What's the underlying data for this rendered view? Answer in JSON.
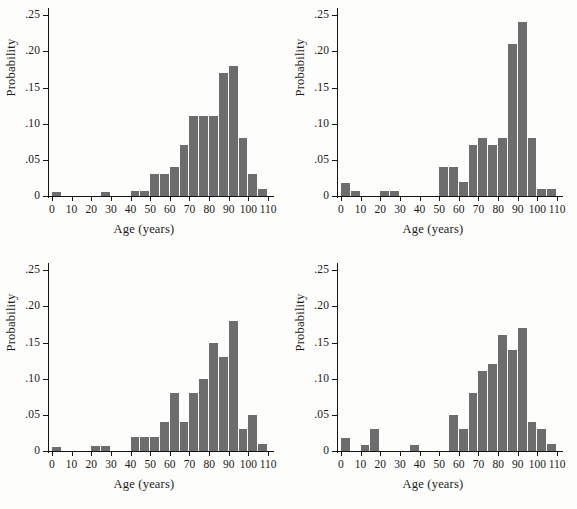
{
  "figure": {
    "background_color": "#fdfdfb",
    "bar_color": "#6d6d6d",
    "axis_color": "#141414",
    "panel_count": 4
  },
  "axes": {
    "x_title": "Age (years)",
    "y_title": "Probability",
    "x_ticks": [
      0,
      10,
      20,
      30,
      40,
      50,
      60,
      70,
      80,
      90,
      100,
      110
    ],
    "x_tick_labels": [
      "0",
      "10",
      "20",
      "30",
      "40",
      "50",
      "60",
      "70",
      "80",
      "90",
      "100",
      "110"
    ],
    "y_ticks": [
      0,
      0.05,
      0.1,
      0.15,
      0.2,
      0.25
    ],
    "y_tick_labels": [
      "0",
      ".05",
      ".10",
      ".15",
      ".20",
      ".25"
    ],
    "xlim": [
      -2,
      113
    ],
    "ylim": [
      0,
      0.26
    ],
    "bin_width": 5,
    "grid": false,
    "legend": false
  },
  "chart_data": [
    {
      "id": "panel-top-left",
      "type": "bar",
      "title": "",
      "xlabel": "Age (years)",
      "ylabel": "Probability",
      "xlim": [
        -2,
        113
      ],
      "ylim": [
        0,
        0.26
      ],
      "grid": false,
      "bin_width": 5,
      "bin_starts": [
        0,
        5,
        10,
        15,
        20,
        25,
        30,
        35,
        40,
        45,
        50,
        55,
        60,
        65,
        70,
        75,
        80,
        85,
        90,
        95,
        100,
        105
      ],
      "categories": [
        "0-5",
        "5-10",
        "10-15",
        "15-20",
        "20-25",
        "25-30",
        "30-35",
        "35-40",
        "40-45",
        "45-50",
        "50-55",
        "55-60",
        "60-65",
        "65-70",
        "70-75",
        "75-80",
        "80-85",
        "85-90",
        "90-95",
        "95-100",
        "100-105",
        "105-110"
      ],
      "values": [
        0.005,
        0,
        0,
        0,
        0,
        0.005,
        0,
        0,
        0.007,
        0.007,
        0.03,
        0.03,
        0.04,
        0.07,
        0.11,
        0.11,
        0.11,
        0.17,
        0.18,
        0.08,
        0.03,
        0.01
      ]
    },
    {
      "id": "panel-top-right",
      "type": "bar",
      "title": "",
      "xlabel": "Age (years)",
      "ylabel": "Probability",
      "xlim": [
        -2,
        113
      ],
      "ylim": [
        0,
        0.26
      ],
      "grid": false,
      "bin_width": 5,
      "bin_starts": [
        0,
        5,
        10,
        15,
        20,
        25,
        30,
        35,
        40,
        45,
        50,
        55,
        60,
        65,
        70,
        75,
        80,
        85,
        90,
        95,
        100,
        105
      ],
      "categories": [
        "0-5",
        "5-10",
        "10-15",
        "15-20",
        "20-25",
        "25-30",
        "30-35",
        "35-40",
        "40-45",
        "45-50",
        "50-55",
        "55-60",
        "60-65",
        "65-70",
        "70-75",
        "75-80",
        "80-85",
        "85-90",
        "90-95",
        "95-100",
        "100-105",
        "105-110"
      ],
      "values": [
        0.018,
        0.007,
        0,
        0,
        0.007,
        0.007,
        0,
        0,
        0,
        0,
        0.04,
        0.04,
        0.02,
        0.07,
        0.08,
        0.07,
        0.08,
        0.21,
        0.24,
        0.08,
        0.01,
        0.01
      ]
    },
    {
      "id": "panel-bottom-left",
      "type": "bar",
      "title": "",
      "xlabel": "Age (years)",
      "ylabel": "Probability",
      "xlim": [
        -2,
        113
      ],
      "ylim": [
        0,
        0.26
      ],
      "grid": false,
      "bin_width": 5,
      "bin_starts": [
        0,
        5,
        10,
        15,
        20,
        25,
        30,
        35,
        40,
        45,
        50,
        55,
        60,
        65,
        70,
        75,
        80,
        85,
        90,
        95,
        100,
        105
      ],
      "categories": [
        "0-5",
        "5-10",
        "10-15",
        "15-20",
        "20-25",
        "25-30",
        "30-35",
        "35-40",
        "40-45",
        "45-50",
        "50-55",
        "55-60",
        "60-65",
        "65-70",
        "70-75",
        "75-80",
        "80-85",
        "85-90",
        "90-95",
        "95-100",
        "100-105",
        "105-110"
      ],
      "values": [
        0.005,
        0,
        0,
        0,
        0.007,
        0.007,
        0,
        0,
        0.02,
        0.02,
        0.02,
        0.04,
        0.08,
        0.04,
        0.08,
        0.1,
        0.15,
        0.13,
        0.18,
        0.03,
        0.05,
        0.01
      ]
    },
    {
      "id": "panel-bottom-right",
      "type": "bar",
      "title": "",
      "xlabel": "Age (years)",
      "ylabel": "Probability",
      "xlim": [
        -2,
        113
      ],
      "ylim": [
        0,
        0.26
      ],
      "grid": false,
      "bin_width": 5,
      "bin_starts": [
        0,
        5,
        10,
        15,
        20,
        25,
        30,
        35,
        40,
        45,
        50,
        55,
        60,
        65,
        70,
        75,
        80,
        85,
        90,
        95,
        100,
        105
      ],
      "categories": [
        "0-5",
        "5-10",
        "10-15",
        "15-20",
        "20-25",
        "25-30",
        "30-35",
        "35-40",
        "40-45",
        "45-50",
        "50-55",
        "55-60",
        "60-65",
        "65-70",
        "70-75",
        "75-80",
        "80-85",
        "85-90",
        "90-95",
        "95-100",
        "100-105",
        "105-110"
      ],
      "values": [
        0.018,
        0,
        0.009,
        0.03,
        0,
        0,
        0,
        0.009,
        0,
        0,
        0,
        0.05,
        0.03,
        0.08,
        0.11,
        0.12,
        0.16,
        0.14,
        0.17,
        0.04,
        0.03,
        0.01
      ]
    }
  ]
}
